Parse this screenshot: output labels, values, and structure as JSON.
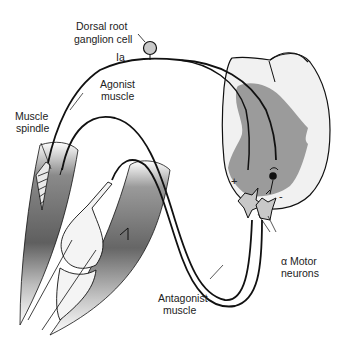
{
  "diagram": {
    "labels": {
      "drg_line1": "Dorsal root",
      "drg_line2": "ganglion cell",
      "ia": "Ia",
      "agonist_line1": "Agonist",
      "agonist_line2": "muscle",
      "spindle_line1": "Muscle",
      "spindle_line2": "spindle",
      "antagonist_line1": "Antagonist",
      "antagonist_line2": "muscle",
      "motor_line1": "α Motor",
      "motor_line2": "neurons",
      "plus": "+",
      "minus": "-"
    },
    "colors": {
      "white_matter": "#efefef",
      "gray_matter": "#9a9a9a",
      "muscle_dark": "#6e6e6e",
      "nerve": "#111111",
      "ganglion": "#c9c9c9"
    }
  }
}
